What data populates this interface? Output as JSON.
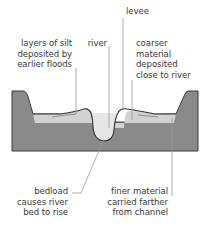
{
  "diagram": {
    "type": "river floodplain cross-section",
    "labels": {
      "levee": "levee",
      "river": "river",
      "silt_layers": [
        "layers of silt",
        "deposited by",
        "earlier floods"
      ],
      "coarser": [
        "coarser",
        "material",
        "deposited",
        "close to river"
      ],
      "bedload": [
        "bedload",
        "causes river",
        "bed to rise"
      ],
      "finer": [
        "finer material",
        "carried farther",
        "from channel"
      ]
    },
    "colors": {
      "bedrock": "#8a8a8a",
      "sediment": "#d4d4d4",
      "water": "#e8e8e8",
      "outline": "#3a3a3a",
      "leader": "#9a9a9a",
      "text": "#3a3a3a"
    }
  }
}
